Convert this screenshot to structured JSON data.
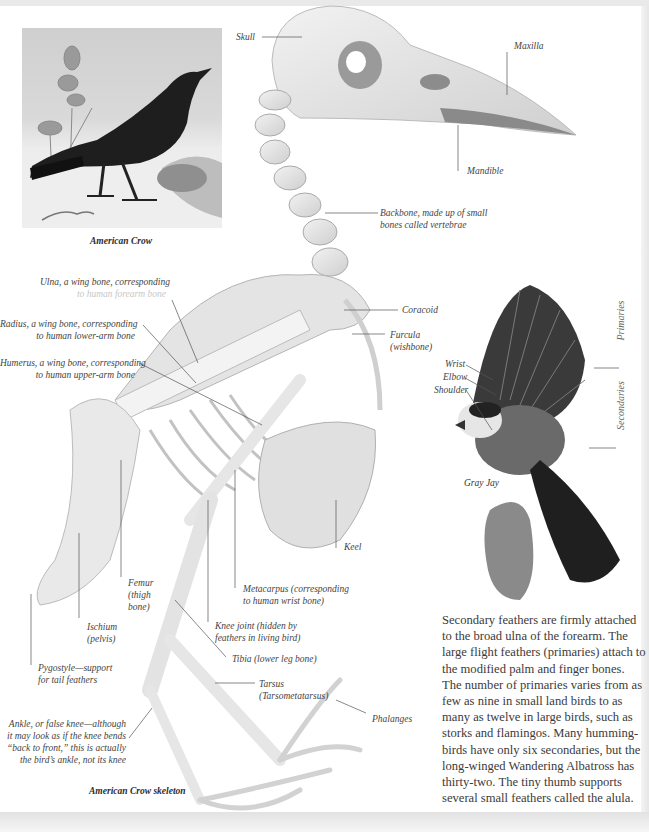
{
  "page": {
    "background": "#ffffff",
    "frame_color": "#e6e6e6"
  },
  "crow_illustration": {
    "caption": "American Crow",
    "alt": "Painted illustration of an American Crow standing in snow"
  },
  "skeleton": {
    "caption": "American Crow skeleton",
    "labels": {
      "skull": "Skull",
      "maxilla": "Maxilla",
      "mandible": "Mandible",
      "backbone": [
        "Backbone, made up of small",
        "bones called vertebrae"
      ],
      "ulna": [
        "Ulna, a wing bone, corresponding",
        "to human forearm bone"
      ],
      "radius": [
        "Radius, a wing bone, corresponding",
        "to human lower-arm bone"
      ],
      "humerus": [
        "Humerus, a wing bone, corresponding",
        "to human upper-arm bone"
      ],
      "coracoid": "Coracoid",
      "furcula": [
        "Furcula",
        "(wishbone)"
      ],
      "keel": "Keel",
      "femur": [
        "Femur",
        "(thigh",
        "bone)"
      ],
      "ischium": [
        "Ischium",
        "(pelvis)"
      ],
      "pygostyle": [
        "Pygostyle—support",
        "for tail feathers"
      ],
      "metacarpus": [
        "Metacarpus (corresponding",
        "to human wrist bone)"
      ],
      "knee_joint": [
        "Knee joint (hidden by",
        "feathers in living bird)"
      ],
      "tibia": "Tibia (lower leg bone)",
      "tarsus": [
        "Tarsus",
        "(Tarsometatarsus)"
      ],
      "phalanges": "Phalanges",
      "ankle": [
        "Ankle, or false knee—although",
        "it may look as if the knee bends",
        "“back to front,” this is actually",
        "the bird’s ankle, not its knee"
      ]
    }
  },
  "gray_jay": {
    "caption": "Gray Jay",
    "labels": {
      "wrist": "Wrist",
      "elbow": "Elbow",
      "shoulder": "Shoulder",
      "primaries": "Primaries",
      "secondaries": "Secondaries"
    }
  },
  "body_text": {
    "lines": [
      "Secondary feathers are firmly attached",
      "to the broad ulna of the forearm. The",
      "large flight feathers (primaries) attach to",
      "the modified palm and finger bones.",
      "The number of primaries varies from as",
      "few as nine in small land birds to as",
      "many as twelve in large birds, such as",
      "storks and flamingos. Many humming-",
      "birds have only six secondaries, but the",
      "long-winged Wandering Albatross has",
      "thirty-two. The tiny thumb supports",
      "several small feathers called the alula."
    ]
  }
}
